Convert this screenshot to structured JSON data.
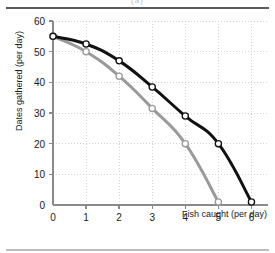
{
  "figure": {
    "top_caption": "(a)"
  },
  "chart_data": {
    "type": "line",
    "title": "",
    "xlabel": "Fish caught (per day)",
    "ylabel": "Dates gathered (per day)",
    "xlim": [
      0,
      6.5
    ],
    "ylim": [
      0,
      60
    ],
    "xticks": [
      0,
      1,
      2,
      3,
      4,
      5,
      6
    ],
    "yticks": [
      0,
      10,
      20,
      30,
      40,
      50,
      60
    ],
    "xtick_labels": [
      "0",
      "1",
      "2",
      "3",
      "4",
      "5",
      "6"
    ],
    "ytick_labels": [
      "0",
      "10",
      "20",
      "30",
      "40",
      "50",
      "60"
    ],
    "grid": true,
    "legend": "none",
    "markers": "open-circle",
    "series": [
      {
        "name": "outer-frontier",
        "color": "#111111",
        "x": [
          0,
          1,
          2,
          3,
          4,
          5,
          6
        ],
        "y": [
          55,
          52.5,
          47,
          38.5,
          29,
          20,
          1
        ]
      },
      {
        "name": "inner-frontier",
        "color": "#9a9a9a",
        "x": [
          0,
          1,
          2,
          3,
          4,
          5
        ],
        "y": [
          55,
          50,
          42,
          31.5,
          20,
          1
        ]
      }
    ]
  }
}
